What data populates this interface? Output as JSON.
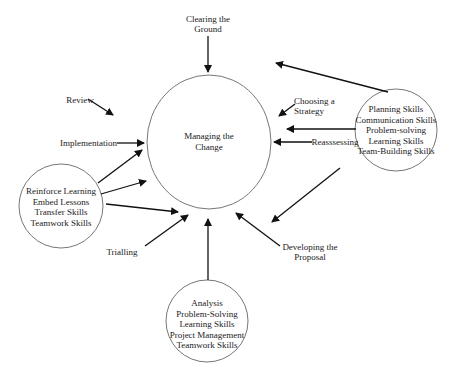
{
  "diagram": {
    "center": {
      "label_lines": [
        "Managing the",
        "Change"
      ]
    },
    "stages": {
      "clearing_the_ground": [
        "Clearing the",
        "Ground"
      ],
      "choosing_a_strategy": [
        "Choosing a",
        "Strategy"
      ],
      "reassessing": "Reasssessing",
      "developing_the_proposal": [
        "Developing the",
        "Proposal"
      ],
      "trialling": "Trialling",
      "implementation": "Implementation",
      "review": "Review"
    },
    "skill_clusters": {
      "right": [
        "Planning Skills",
        "Communication Skills",
        "Problem-solving",
        "Learning Skills",
        "Team-Building Skills"
      ],
      "left": [
        "Reinforce Learning",
        "Embed Lessons",
        "Transfer Skills",
        "Teamwork Skills"
      ],
      "bottom": [
        "Analysis",
        "Problem-Solving",
        "Learning Skills",
        "Project Management",
        "Teamwork Skills"
      ]
    },
    "colors": {
      "line": "#111111",
      "circle_stroke": "#777777",
      "background": "#ffffff"
    }
  }
}
